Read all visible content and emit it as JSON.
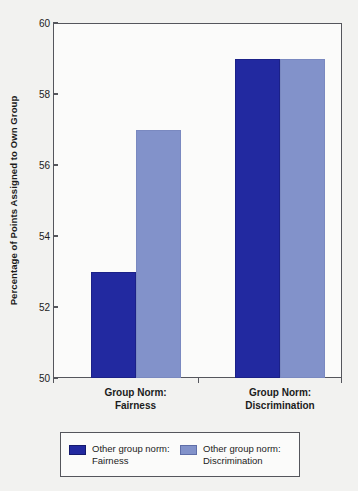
{
  "chart_data": {
    "type": "bar",
    "title": "",
    "xlabel": "",
    "ylabel": "Percentage of Points Assigned to Own Group",
    "ylim": [
      50,
      60
    ],
    "yticks": [
      50,
      52,
      54,
      56,
      58,
      60
    ],
    "ytick_labels": [
      "50",
      "52",
      "54",
      "56",
      "58",
      "60"
    ],
    "grid": false,
    "legend_position": "bottom",
    "categories": [
      "Group Norm:\nFairness",
      "Group Norm:\nDiscrimination"
    ],
    "category_lines": [
      [
        "Group Norm:",
        "Fairness"
      ],
      [
        "Group Norm:",
        "Discrimination"
      ]
    ],
    "series": [
      {
        "name": "Other group norm:\nFairness",
        "name_lines": [
          "Other group norm:",
          "Fairness"
        ],
        "color": "#2229a0",
        "values": [
          53,
          59
        ]
      },
      {
        "name": "Other group norm:\nDiscrimination",
        "name_lines": [
          "Other group norm:",
          "Discrimination"
        ],
        "color": "#8292ca",
        "values": [
          57,
          59
        ]
      }
    ]
  },
  "colors": {
    "dark_blue": "#2229a0",
    "light_blue": "#8292ca",
    "axis": "#55565c",
    "text": "#1b1b1b",
    "background": "#f2f2f0",
    "plot_background": "#fbfbfa"
  },
  "legend": {
    "entries": [
      {
        "label": "Other group norm:\nFairness",
        "swatch": "dark"
      },
      {
        "label": "Other group norm:\nDiscrimination",
        "swatch": "light"
      }
    ]
  }
}
